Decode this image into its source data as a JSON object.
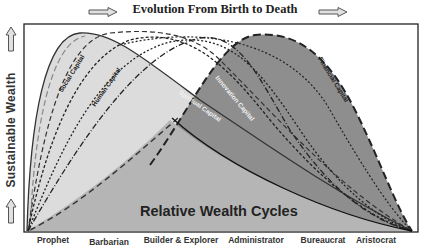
{
  "header": {
    "title": "Evolution From Birth to Death"
  },
  "y_axis": {
    "label": "Sustainable Wealth"
  },
  "x_axis": {
    "stages": [
      "Prophet",
      "Barbarian",
      "Builder & Explorer",
      "Administrator",
      "Bureaucrat",
      "Aristocrat"
    ]
  },
  "diagram": {
    "caption": "Relative Wealth Cycles",
    "curves": [
      {
        "name": "Social Capital",
        "style": "solid",
        "fill": "#dcdcdc"
      },
      {
        "name": "Human Capital",
        "style": "dashed-light"
      },
      {
        "name": "Spiritual Capital",
        "style": "solid",
        "fill": "#b5b5b5"
      },
      {
        "name": "Innovation Capital",
        "style": "dashed"
      },
      {
        "name": "Financial Capital",
        "style": "long-dashed",
        "fill": "#8e8e8e"
      }
    ],
    "curve_labels": {
      "social": "Social Capital",
      "human": "Human Capital",
      "spiritual": "Spiritual Capital",
      "innovation": "Innovation Capital",
      "financial": "Financial Capital"
    }
  },
  "colors": {
    "light_fill": "#dedede",
    "mid_fill": "#b3b3b3",
    "dark_fill": "#8c8c8c",
    "line": "#222222"
  }
}
